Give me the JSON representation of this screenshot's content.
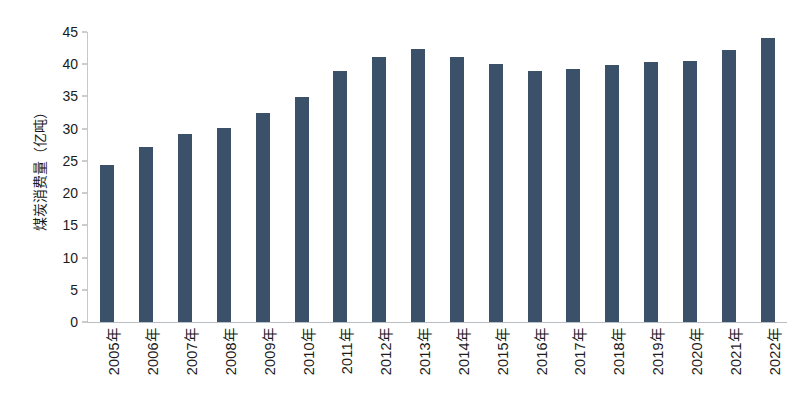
{
  "chart_data": {
    "type": "bar",
    "title": "",
    "subtitle": "",
    "xlabel": "",
    "ylabel": "煤炭消费量（亿吨）",
    "categories": [
      "2005年",
      "2006年",
      "2007年",
      "2008年",
      "2009年",
      "2010年",
      "2011年",
      "2012年",
      "2013年",
      "2014年",
      "2015年",
      "2016年",
      "2017年",
      "2018年",
      "2019年",
      "2020年",
      "2021年",
      "2022年"
    ],
    "values": [
      24.4,
      27.1,
      29.1,
      30.1,
      32.5,
      34.9,
      39.0,
      41.1,
      42.3,
      41.2,
      40.1,
      39.0,
      39.3,
      39.9,
      40.3,
      40.5,
      42.2,
      44.0
    ],
    "series": [
      {
        "name": "煤炭消费量",
        "values": [
          24.4,
          27.1,
          29.1,
          30.1,
          32.5,
          34.9,
          39.0,
          41.1,
          42.3,
          41.2,
          40.1,
          39.0,
          39.3,
          39.9,
          40.3,
          40.5,
          42.2,
          44.0
        ],
        "color": "#3a5169"
      }
    ],
    "ylim": [
      0,
      45
    ],
    "ytick_values": [
      0,
      5,
      10,
      15,
      20,
      25,
      30,
      35,
      40,
      45
    ],
    "ytick_labels": [
      "0",
      "5",
      "10",
      "15",
      "20",
      "25",
      "30",
      "35",
      "40",
      "45"
    ],
    "grid": false,
    "legend": false,
    "legend_position": "none",
    "bar_color": "#3a5169",
    "background_color": "#ffffff",
    "axis_color": "#b9bfc5",
    "text_color": "#1b1b1b"
  }
}
